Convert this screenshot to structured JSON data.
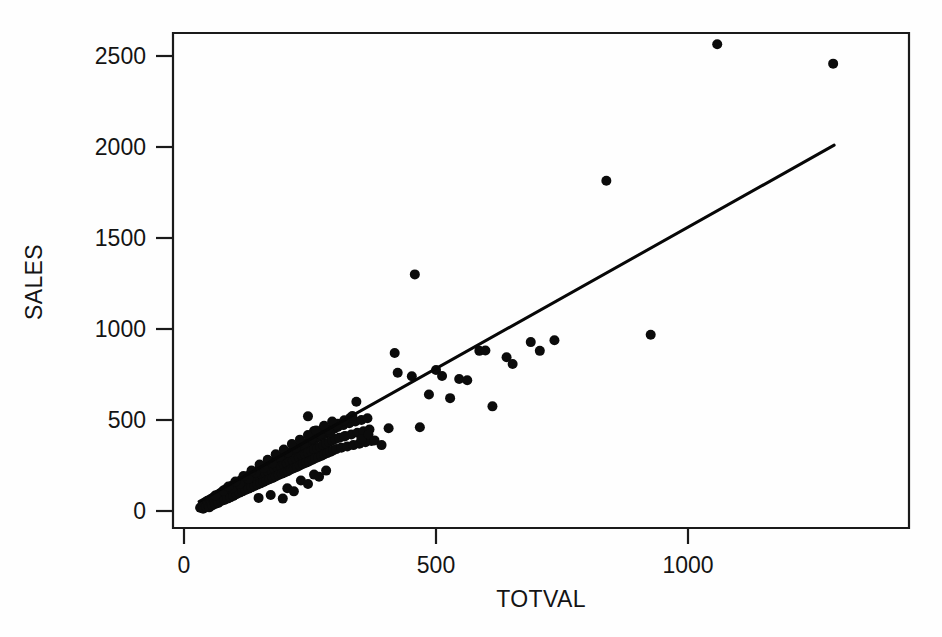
{
  "chart_data": {
    "type": "scatter",
    "title": "",
    "subtitle": "",
    "xlabel": "TOTVAL",
    "ylabel": "SALES",
    "xlim": [
      0,
      1305
    ],
    "ylim": [
      -40,
      2660
    ],
    "xticks": [
      0,
      500,
      1000
    ],
    "xtick_labels": [
      "0",
      "500",
      "1000"
    ],
    "yticks": [
      0,
      500,
      1000,
      1500,
      2000,
      2500
    ],
    "ytick_labels": [
      "0",
      "500",
      "1000",
      "1500",
      "2000",
      "2500"
    ],
    "grid": false,
    "legend": null,
    "point_color": "#0b0b0b",
    "line_color": "#070707",
    "axis_color": "#1a1a1a",
    "background_color": "#fefefe",
    "marker_radius_px": 5,
    "series": [
      {
        "name": "observations",
        "marker": "filled-circle",
        "points": [
          [
            32,
            18
          ],
          [
            36,
            30
          ],
          [
            38,
            12
          ],
          [
            41,
            42
          ],
          [
            44,
            25
          ],
          [
            46,
            55
          ],
          [
            48,
            35
          ],
          [
            50,
            20
          ],
          [
            52,
            60
          ],
          [
            54,
            45
          ],
          [
            56,
            30
          ],
          [
            58,
            72
          ],
          [
            60,
            50
          ],
          [
            62,
            38
          ],
          [
            64,
            85
          ],
          [
            66,
            62
          ],
          [
            68,
            44
          ],
          [
            70,
            95
          ],
          [
            72,
            70
          ],
          [
            74,
            55
          ],
          [
            76,
            105
          ],
          [
            78,
            80
          ],
          [
            80,
            60
          ],
          [
            82,
            118
          ],
          [
            84,
            90
          ],
          [
            86,
            68
          ],
          [
            88,
            128
          ],
          [
            90,
            100
          ],
          [
            92,
            75
          ],
          [
            94,
            138
          ],
          [
            96,
            110
          ],
          [
            98,
            82
          ],
          [
            100,
            148
          ],
          [
            102,
            120
          ],
          [
            104,
            92
          ],
          [
            106,
            158
          ],
          [
            108,
            128
          ],
          [
            110,
            100
          ],
          [
            112,
            168
          ],
          [
            114,
            135
          ],
          [
            116,
            108
          ],
          [
            118,
            178
          ],
          [
            120,
            145
          ],
          [
            122,
            115
          ],
          [
            124,
            188
          ],
          [
            126,
            155
          ],
          [
            128,
            122
          ],
          [
            130,
            198
          ],
          [
            132,
            162
          ],
          [
            134,
            130
          ],
          [
            136,
            208
          ],
          [
            138,
            170
          ],
          [
            140,
            138
          ],
          [
            142,
            215
          ],
          [
            144,
            178
          ],
          [
            146,
            145
          ],
          [
            148,
            225
          ],
          [
            150,
            188
          ],
          [
            152,
            152
          ],
          [
            154,
            235
          ],
          [
            156,
            195
          ],
          [
            158,
            160
          ],
          [
            160,
            245
          ],
          [
            162,
            205
          ],
          [
            164,
            168
          ],
          [
            166,
            252
          ],
          [
            168,
            212
          ],
          [
            170,
            175
          ],
          [
            172,
            262
          ],
          [
            174,
            220
          ],
          [
            176,
            182
          ],
          [
            178,
            272
          ],
          [
            180,
            228
          ],
          [
            182,
            190
          ],
          [
            184,
            280
          ],
          [
            186,
            238
          ],
          [
            188,
            198
          ],
          [
            190,
            290
          ],
          [
            192,
            245
          ],
          [
            194,
            205
          ],
          [
            196,
            298
          ],
          [
            198,
            255
          ],
          [
            200,
            212
          ],
          [
            202,
            308
          ],
          [
            204,
            262
          ],
          [
            206,
            218
          ],
          [
            208,
            318
          ],
          [
            210,
            270
          ],
          [
            212,
            228
          ],
          [
            214,
            325
          ],
          [
            216,
            278
          ],
          [
            218,
            235
          ],
          [
            220,
            335
          ],
          [
            222,
            288
          ],
          [
            224,
            242
          ],
          [
            226,
            345
          ],
          [
            228,
            295
          ],
          [
            230,
            250
          ],
          [
            232,
            352
          ],
          [
            234,
            305
          ],
          [
            236,
            258
          ],
          [
            238,
            362
          ],
          [
            240,
            312
          ],
          [
            242,
            265
          ],
          [
            244,
            372
          ],
          [
            246,
            320
          ],
          [
            248,
            272
          ],
          [
            250,
            380
          ],
          [
            252,
            330
          ],
          [
            254,
            280
          ],
          [
            256,
            388
          ],
          [
            258,
            338
          ],
          [
            260,
            288
          ],
          [
            262,
            398
          ],
          [
            264,
            345
          ],
          [
            266,
            295
          ],
          [
            268,
            408
          ],
          [
            270,
            352
          ],
          [
            272,
            302
          ],
          [
            274,
            415
          ],
          [
            276,
            362
          ],
          [
            278,
            310
          ],
          [
            280,
            425
          ],
          [
            282,
            370
          ],
          [
            284,
            318
          ],
          [
            286,
            435
          ],
          [
            288,
            378
          ],
          [
            290,
            325
          ],
          [
            292,
            442
          ],
          [
            294,
            388
          ],
          [
            296,
            332
          ],
          [
            298,
            452
          ],
          [
            300,
            395
          ],
          [
            302,
            340
          ],
          [
            305,
            462
          ],
          [
            308,
            402
          ],
          [
            312,
            348
          ],
          [
            316,
            472
          ],
          [
            320,
            412
          ],
          [
            324,
            355
          ],
          [
            328,
            482
          ],
          [
            332,
            420
          ],
          [
            336,
            362
          ],
          [
            340,
            492
          ],
          [
            344,
            430
          ],
          [
            348,
            370
          ],
          [
            352,
            500
          ],
          [
            356,
            438
          ],
          [
            360,
            378
          ],
          [
            364,
            510
          ],
          [
            368,
            448
          ],
          [
            372,
            385
          ],
          [
            148,
            72
          ],
          [
            172,
            88
          ],
          [
            196,
            68
          ],
          [
            205,
            125
          ],
          [
            218,
            108
          ],
          [
            232,
            168
          ],
          [
            246,
            148
          ],
          [
            258,
            200
          ],
          [
            268,
            188
          ],
          [
            282,
            222
          ],
          [
            246,
            520
          ],
          [
            258,
            440
          ],
          [
            276,
            455
          ],
          [
            290,
            432
          ],
          [
            305,
            480
          ],
          [
            318,
            410
          ],
          [
            330,
            512
          ],
          [
            342,
            600
          ],
          [
            352,
            395
          ],
          [
            366,
            420
          ],
          [
            378,
            388
          ],
          [
            392,
            362
          ],
          [
            406,
            455
          ],
          [
            418,
            868
          ],
          [
            424,
            760
          ],
          [
            458,
            1300
          ],
          [
            452,
            740
          ],
          [
            468,
            460
          ],
          [
            486,
            640
          ],
          [
            500,
            775
          ],
          [
            512,
            742
          ],
          [
            528,
            620
          ],
          [
            546,
            725
          ],
          [
            562,
            718
          ],
          [
            586,
            880
          ],
          [
            598,
            882
          ],
          [
            612,
            575
          ],
          [
            640,
            845
          ],
          [
            652,
            808
          ],
          [
            688,
            928
          ],
          [
            706,
            880
          ],
          [
            735,
            938
          ],
          [
            838,
            1815
          ],
          [
            926,
            968
          ],
          [
            1058,
            2565
          ],
          [
            1288,
            2458
          ],
          [
            95,
            125
          ],
          [
            110,
            148
          ],
          [
            128,
            178
          ],
          [
            142,
            212
          ],
          [
            158,
            238
          ],
          [
            175,
            262
          ],
          [
            190,
            298
          ],
          [
            206,
            322
          ],
          [
            222,
            348
          ],
          [
            238,
            372
          ],
          [
            254,
            398
          ],
          [
            270,
            422
          ],
          [
            286,
            448
          ],
          [
            302,
            472
          ],
          [
            318,
            498
          ],
          [
            334,
            522
          ],
          [
            62,
            85
          ],
          [
            78,
            112
          ],
          [
            88,
            135
          ],
          [
            102,
            162
          ],
          [
            118,
            192
          ],
          [
            134,
            222
          ],
          [
            150,
            255
          ],
          [
            166,
            282
          ],
          [
            182,
            312
          ],
          [
            198,
            338
          ],
          [
            214,
            368
          ],
          [
            230,
            392
          ],
          [
            246,
            418
          ],
          [
            262,
            442
          ],
          [
            278,
            468
          ],
          [
            294,
            492
          ]
        ]
      }
    ],
    "fit_line": {
      "name": "regression-line",
      "x_start": 30,
      "y_start": 52,
      "x_end": 1290,
      "y_end": 2010
    }
  }
}
